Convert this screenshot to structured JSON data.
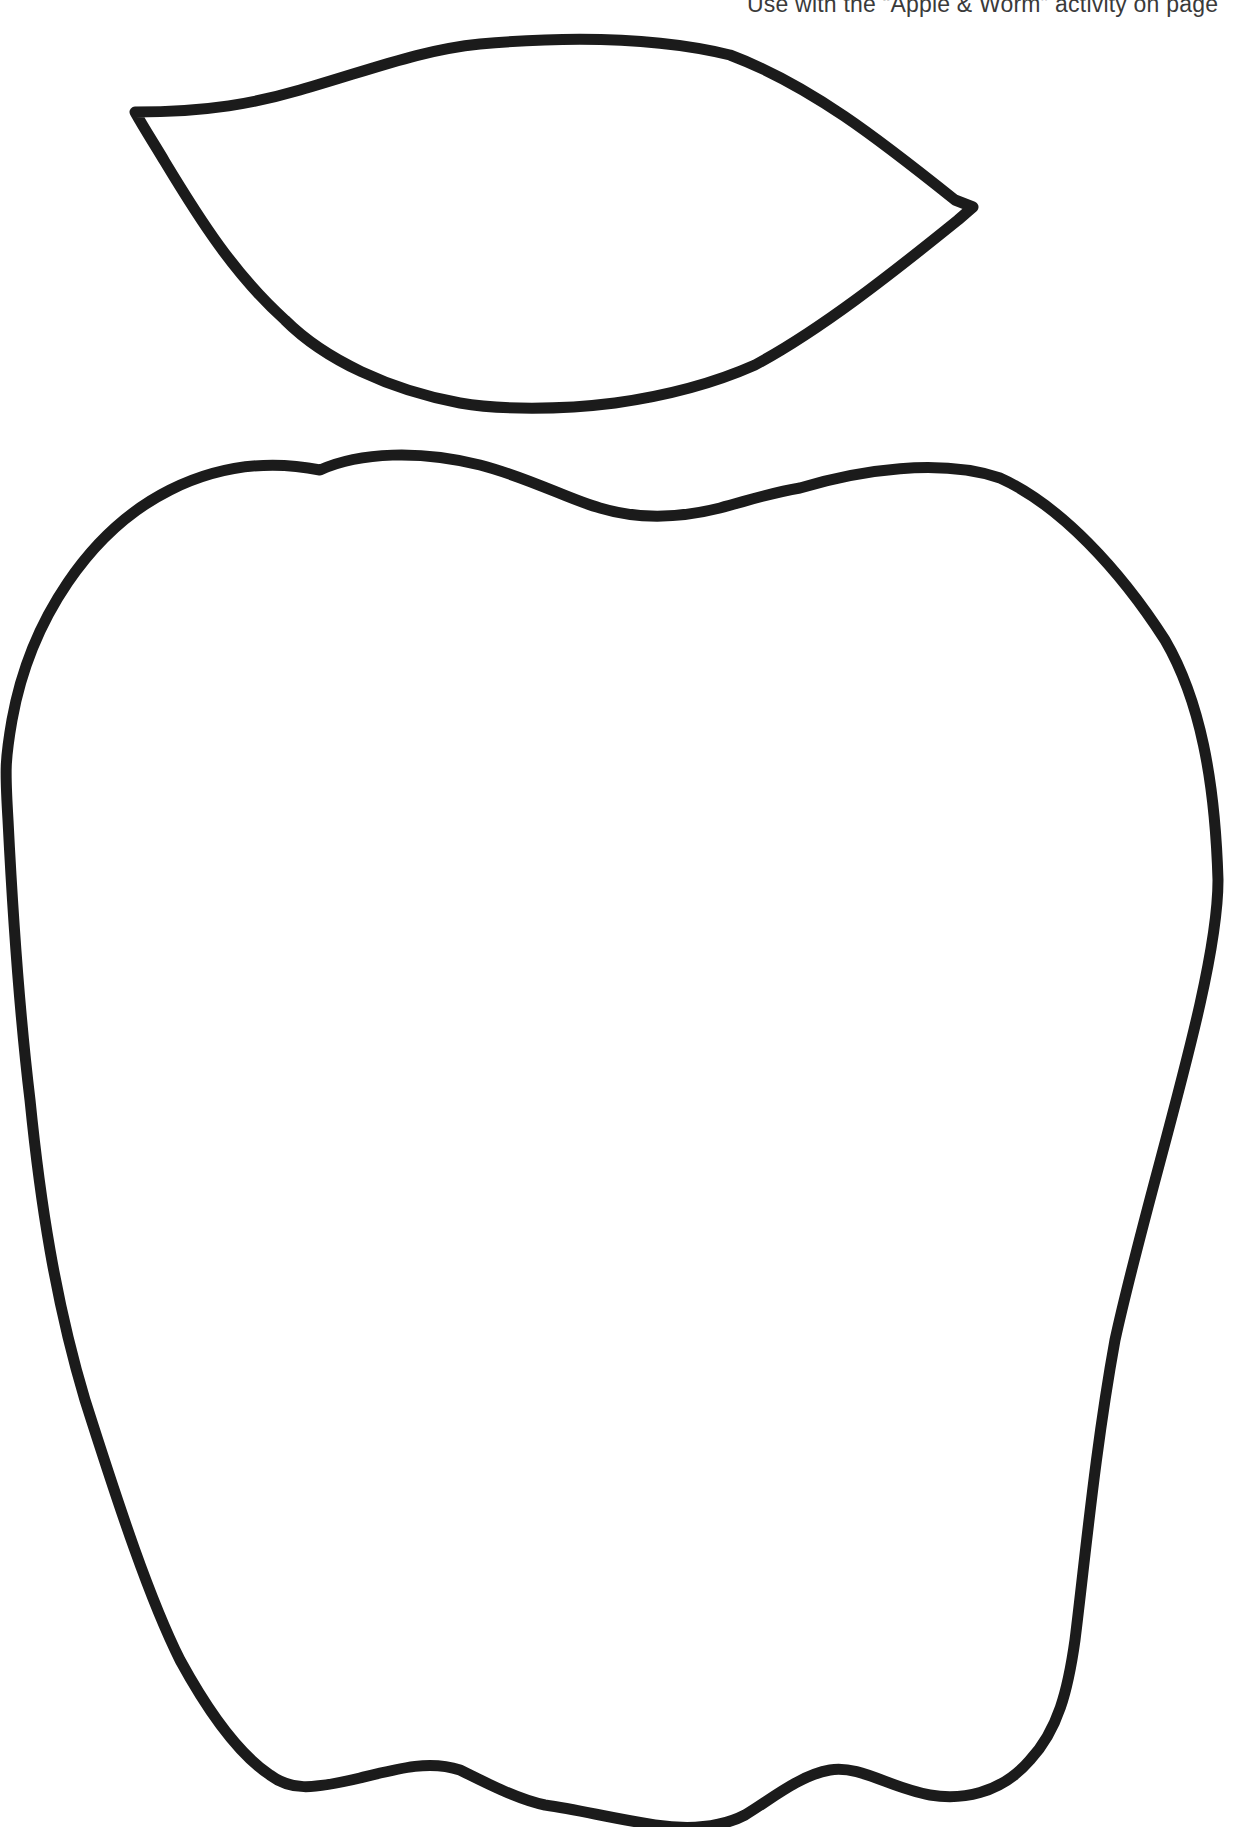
{
  "page": {
    "instruction_text": "Use with the “Apple & Worm” activity on page",
    "background_color": "#ffffff",
    "outline_color": "#1b1b1b"
  },
  "shapes": [
    {
      "name": "leaf",
      "kind": "outline"
    },
    {
      "name": "apple",
      "kind": "outline"
    }
  ]
}
